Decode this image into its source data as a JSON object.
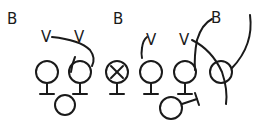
{
  "diagram": {
    "type": "football-play",
    "stroke_color": "#1a1a1a",
    "background": "#ffffff",
    "defenders": [
      {
        "label": "B",
        "x": 12,
        "y": 24
      },
      {
        "label": "B",
        "x": 118,
        "y": 24
      },
      {
        "label": "B",
        "x": 216,
        "y": 23
      },
      {
        "label": "V",
        "x": 47,
        "y": 41
      },
      {
        "label": "V",
        "x": 80,
        "y": 41
      },
      {
        "label": "V",
        "x": 151,
        "y": 44
      },
      {
        "label": "V",
        "x": 185,
        "y": 44
      }
    ],
    "offense": [
      {
        "role": "lineman",
        "x": 47,
        "y": 72,
        "mark": ""
      },
      {
        "role": "lineman",
        "x": 80,
        "y": 72,
        "mark": ""
      },
      {
        "role": "center",
        "x": 117,
        "y": 72,
        "mark": "X"
      },
      {
        "role": "lineman",
        "x": 151,
        "y": 72,
        "mark": ""
      },
      {
        "role": "lineman",
        "x": 185,
        "y": 72,
        "mark": ""
      },
      {
        "role": "end",
        "x": 221,
        "y": 72,
        "mark": ""
      },
      {
        "role": "back",
        "x": 65,
        "y": 105,
        "mark": ""
      },
      {
        "role": "back",
        "x": 171,
        "y": 108,
        "mark": ""
      }
    ]
  }
}
